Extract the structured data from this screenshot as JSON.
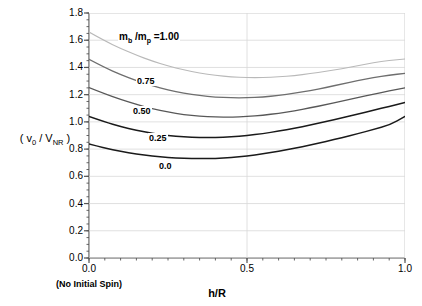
{
  "chart_data": {
    "type": "line",
    "title": "",
    "xlabel": "h/R",
    "ylabel": "( v0 / VNR )",
    "xlim": [
      0.0,
      1.0
    ],
    "ylim": [
      0.0,
      1.8
    ],
    "grid": true,
    "legend_position": "inline-labels",
    "x_ticks": [
      "0.0",
      "0.5",
      "1.0"
    ],
    "x_tick_values": [
      0.0,
      0.5,
      1.0
    ],
    "y_ticks": [
      "0.0",
      "0.2",
      "0.4",
      "0.6",
      "0.8",
      "1.0",
      "1.2",
      "1.4",
      "1.6",
      "1.8"
    ],
    "y_tick_values": [
      0.0,
      0.2,
      0.4,
      0.6,
      0.8,
      1.0,
      1.2,
      1.4,
      1.6,
      1.8
    ],
    "y_minor_tick_step": 0.05,
    "annotations": {
      "x_axis_note": "(No Initial Spin)",
      "legend_head": "mb /mp =1.00"
    },
    "x": [
      0.0,
      0.05,
      0.1,
      0.15,
      0.2,
      0.25,
      0.3,
      0.35,
      0.4,
      0.45,
      0.5,
      0.55,
      0.6,
      0.65,
      0.7,
      0.75,
      0.8,
      0.85,
      0.9,
      0.95,
      1.0
    ],
    "series": [
      {
        "name": "mb/mp = 1.00",
        "label": "1.00",
        "color": "#b9b9b9",
        "width": 1.1,
        "values": [
          1.66,
          1.595,
          1.54,
          1.49,
          1.447,
          1.411,
          1.382,
          1.359,
          1.342,
          1.331,
          1.325,
          1.325,
          1.33,
          1.34,
          1.354,
          1.371,
          1.391,
          1.413,
          1.435,
          1.452,
          1.462
        ]
      },
      {
        "name": "mb/mp = 0.75",
        "label": "0.75",
        "color": "#6e6e6e",
        "width": 1.3,
        "values": [
          1.46,
          1.399,
          1.348,
          1.303,
          1.265,
          1.234,
          1.21,
          1.193,
          1.182,
          1.177,
          1.177,
          1.183,
          1.194,
          1.21,
          1.23,
          1.253,
          1.278,
          1.303,
          1.325,
          1.344,
          1.356
        ]
      },
      {
        "name": "mb/mp = 0.50",
        "label": "0.50",
        "color": "#585858",
        "width": 1.3,
        "values": [
          1.252,
          1.206,
          1.165,
          1.128,
          1.097,
          1.072,
          1.054,
          1.042,
          1.036,
          1.035,
          1.039,
          1.049,
          1.063,
          1.081,
          1.103,
          1.127,
          1.152,
          1.178,
          1.203,
          1.228,
          1.25
        ]
      },
      {
        "name": "mb/mp = 0.25",
        "label": "0.25",
        "color": "#1a1a1a",
        "width": 1.5,
        "values": [
          1.04,
          1.0,
          0.966,
          0.938,
          0.916,
          0.9,
          0.89,
          0.885,
          0.885,
          0.89,
          0.9,
          0.914,
          0.932,
          0.953,
          0.977,
          1.002,
          1.029,
          1.057,
          1.085,
          1.114,
          1.142
        ]
      },
      {
        "name": "mb/mp = 0.0",
        "label": "0.0",
        "color": "#1a1a1a",
        "width": 1.5,
        "values": [
          0.838,
          0.808,
          0.784,
          0.764,
          0.749,
          0.738,
          0.732,
          0.73,
          0.732,
          0.739,
          0.75,
          0.765,
          0.784,
          0.806,
          0.83,
          0.856,
          0.884,
          0.913,
          0.944,
          0.976,
          1.04
        ]
      }
    ]
  },
  "axes": {
    "y_title_prefix": "( v",
    "y_title_sub1": "0",
    "y_title_mid": " / V",
    "y_title_sub2": "NR",
    "y_title_suffix": " )",
    "x_title": "h/R",
    "x_note": "(No Initial Spin)"
  },
  "legend": {
    "head_m": "m",
    "head_sub_b": "b",
    "head_slash_m": " /m",
    "head_sub_p": "p",
    "head_eq": " =1.00",
    "label_075": "0.75",
    "label_050": "0.50",
    "label_025": "0.25",
    "label_000": "0.0"
  },
  "colors": {
    "axis": "#555555",
    "grid": "#d8d8d8",
    "background": "#ffffff"
  }
}
